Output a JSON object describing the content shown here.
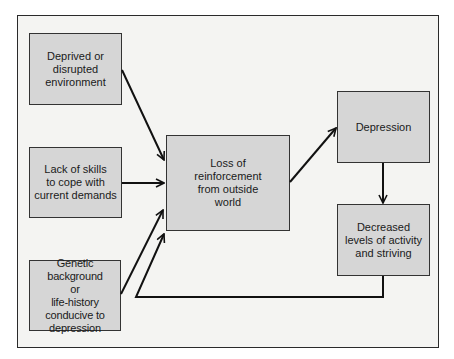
{
  "diagram": {
    "nodes": {
      "deprived": "Deprived or\ndisrupted\nenvironment",
      "lack_skills": "Lack of skills\nto cope with\ncurrent demands",
      "genetic": "Genetic background\nor\nlife-history\nconducive to\ndepression",
      "loss": "Loss of\nreinforcement\nfrom outside\nworld",
      "depression": "Depression",
      "decreased": "Decreased\nlevels of activity\nand striving"
    },
    "edges": [
      {
        "from": "deprived",
        "to": "loss"
      },
      {
        "from": "lack_skills",
        "to": "loss"
      },
      {
        "from": "genetic",
        "to": "loss"
      },
      {
        "from": "loss",
        "to": "depression"
      },
      {
        "from": "depression",
        "to": "decreased"
      },
      {
        "from": "decreased",
        "to": "loss",
        "type": "feedback"
      }
    ]
  }
}
